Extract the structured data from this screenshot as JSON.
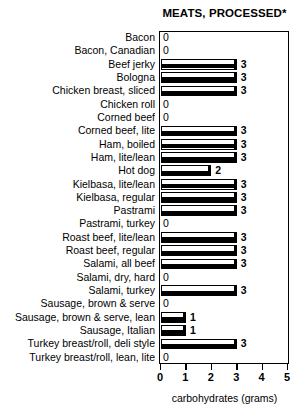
{
  "chart_data": {
    "type": "bar",
    "orientation": "horizontal",
    "title": "MEATS, PROCESSED*",
    "xlabel": "carbohydrates (grams)",
    "ylabel": "",
    "xlim": [
      0,
      5
    ],
    "xticks": [
      0,
      1,
      2,
      3,
      4,
      5
    ],
    "xtick_labels": [
      "0",
      "1",
      "2",
      "3",
      "4",
      "5"
    ],
    "grid": false,
    "legend": null,
    "categories": [
      "Bacon",
      "Bacon, Canadian",
      "Beef jerky",
      "Bologna",
      "Chicken breast, sliced",
      "Chicken roll",
      "Corned beef",
      "Corned beef, lite",
      "Ham, boiled",
      "Ham, lite/lean",
      "Hot dog",
      "Kielbasa, lite/lean",
      "Kielbasa, regular",
      "Pastrami",
      "Pastrami, turkey",
      "Roast beef, lite/lean",
      "Roast beef, regular",
      "Salami, all beef",
      "Salami, dry, hard",
      "Salami, turkey",
      "Sausage, brown & serve",
      "Sausage, brown & serve, lean",
      "Sausage, Italian",
      "Turkey breast/roll, deli style",
      "Turkey breast/roll, lean, lite"
    ],
    "values": [
      0,
      0,
      3,
      3,
      3,
      0,
      0,
      3,
      3,
      3,
      2,
      3,
      3,
      3,
      0,
      3,
      3,
      3,
      0,
      3,
      0,
      1,
      1,
      3,
      0
    ],
    "value_labels": [
      "0",
      "0",
      "3",
      "3",
      "3",
      "0",
      "0",
      "3",
      "3",
      "3",
      "2",
      "3",
      "3",
      "3",
      "0",
      "3",
      "3",
      "3",
      "0",
      "3",
      "0",
      "1",
      "1",
      "3",
      "0"
    ],
    "colors": {
      "bar_fill": "#ffffff",
      "bar_outline": "#000000",
      "bar_shadow": "#000000",
      "axis": "#000000",
      "text": "#000000",
      "background": "#ffffff"
    }
  }
}
